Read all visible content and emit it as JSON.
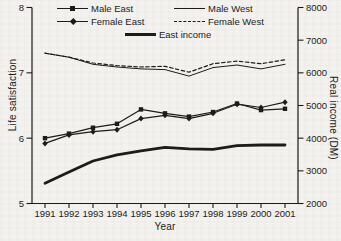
{
  "colors": {
    "background": "#f3f2ef",
    "ink": "#1c1c1c"
  },
  "chart_data": {
    "type": "line",
    "x": [
      1991,
      1992,
      1993,
      1994,
      1995,
      1996,
      1997,
      1998,
      1999,
      2000,
      2001
    ],
    "xlabel": "Year",
    "ylabel_left": "Life satisfaction",
    "ylabel_right": "Real income (DM)",
    "ylim_left": [
      5,
      8
    ],
    "yticks_left": [
      5,
      6,
      7,
      8
    ],
    "ylim_right": [
      2000,
      8000
    ],
    "yticks_right": [
      2000,
      3000,
      4000,
      5000,
      6000,
      7000,
      8000
    ],
    "grid": false,
    "legend_position": "top-inside",
    "series": [
      {
        "name": "Male East",
        "axis": "left",
        "marker": "square",
        "line": "solid",
        "width": 1.2,
        "values": [
          6.0,
          6.07,
          6.16,
          6.22,
          6.44,
          6.38,
          6.33,
          6.4,
          6.53,
          6.43,
          6.45
        ]
      },
      {
        "name": "Male West",
        "axis": "left",
        "marker": "none",
        "line": "solid",
        "width": 1.0,
        "values": [
          7.3,
          7.24,
          7.13,
          7.09,
          7.06,
          7.05,
          6.95,
          7.08,
          7.12,
          7.06,
          7.13
        ]
      },
      {
        "name": "Female East",
        "axis": "left",
        "marker": "diamond",
        "line": "solid",
        "width": 1.2,
        "values": [
          5.92,
          6.05,
          6.1,
          6.13,
          6.3,
          6.35,
          6.3,
          6.38,
          6.52,
          6.47,
          6.55
        ]
      },
      {
        "name": "Female West",
        "axis": "left",
        "marker": "none",
        "line": "dashed",
        "width": 1.2,
        "values": [
          7.3,
          7.24,
          7.15,
          7.11,
          7.09,
          7.1,
          7.01,
          7.14,
          7.18,
          7.14,
          7.2
        ]
      },
      {
        "name": "East income",
        "axis": "right",
        "marker": "none",
        "line": "solid",
        "width": 2.8,
        "values": [
          2620,
          2960,
          3300,
          3490,
          3610,
          3720,
          3670,
          3660,
          3770,
          3790,
          3790
        ]
      }
    ]
  }
}
